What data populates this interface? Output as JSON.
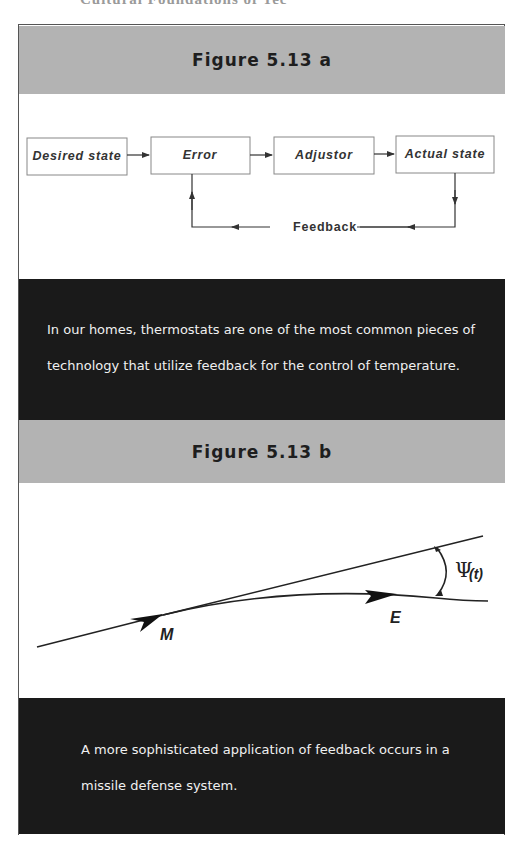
{
  "header_cutoff_text": "Cultural Foundations of Tec",
  "figure_a": {
    "title": "Figure 5.13 a",
    "diagram": {
      "boxes": [
        "Desired state",
        "Error",
        "Adjustor",
        "Actual state"
      ],
      "feedback_label": "Feedback"
    },
    "caption_lines": [
      "In our homes, thermostats are one of the most common pieces of",
      "technology that utilize feedback for the control of temperature."
    ]
  },
  "figure_b": {
    "title": "Figure 5.13 b",
    "diagram": {
      "point_missile": "M",
      "point_enemy": "E",
      "angle_symbol": "Ψ",
      "angle_arg": "(t)"
    },
    "caption_lines": [
      "A more sophisticated application of feedback occurs in a",
      "missile defense system."
    ]
  },
  "colors": {
    "title_band": "#b3b3b3",
    "caption_band": "#1a1a1a",
    "caption_text": "#f0f0f0",
    "line": "#333333"
  }
}
